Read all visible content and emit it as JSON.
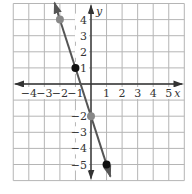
{
  "chart_data": {
    "type": "line",
    "title": "",
    "xlabel": "x",
    "ylabel": "y",
    "xlim": [
      -5,
      6
    ],
    "ylim": [
      -6,
      5
    ],
    "grid": true,
    "x_ticks": [
      -4,
      -3,
      -2,
      -1,
      1,
      2,
      3,
      4,
      5
    ],
    "y_ticks": [
      4,
      3,
      2,
      1,
      -2,
      -3,
      -4,
      -5
    ],
    "x_tick_labels": [
      "−4",
      "−3",
      "−2",
      "−1",
      "1",
      "2",
      "3",
      "4",
      "5"
    ],
    "y_tick_labels": [
      "4",
      "3",
      "2",
      "1",
      "−2",
      "−3",
      "−4",
      "−5"
    ],
    "series": [
      {
        "name": "line",
        "equation": "y = -3x - 2",
        "slope": -3,
        "intercept": -2,
        "color": "#555555",
        "arrows": "both",
        "x_range": [
          -2.35,
          1.25
        ]
      }
    ],
    "points": [
      {
        "x": -2,
        "y": 4,
        "color": "#888888"
      },
      {
        "x": -1,
        "y": 1,
        "color": "#111111"
      },
      {
        "x": 0,
        "y": -2,
        "color": "#888888"
      },
      {
        "x": 1,
        "y": -5,
        "color": "#111111"
      }
    ],
    "colors": {
      "grid": "#b5b5b5",
      "axis": "#333333",
      "line": "#555555"
    }
  }
}
